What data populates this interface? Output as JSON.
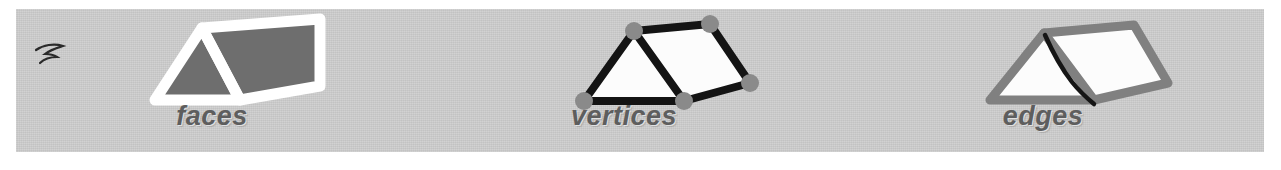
{
  "figure": {
    "background_color": "#ffffff",
    "band_color": "#cdcdcd"
  },
  "panels": [
    {
      "id": "faces",
      "caption": "faces",
      "shape": "triangular-prism",
      "highlight": "faces",
      "outline_color": "#ffffff",
      "fill_color": "#6e6e6e",
      "caption_color": "#5e5e5e",
      "has_ink_mark": true
    },
    {
      "id": "vertices",
      "caption": "vertices",
      "shape": "triangular-prism",
      "highlight": "vertices",
      "outline_color": "#111111",
      "fill_color": "#ffffff",
      "vertex_dot_color": "#8a8a8a",
      "vertex_count": 5,
      "caption_color": "#5e5e5e",
      "has_ink_mark": false
    },
    {
      "id": "edges",
      "caption": "edges",
      "shape": "triangular-prism",
      "highlight": "edges",
      "outline_color": "#808080",
      "fill_color": "#ffffff",
      "accent_edge_color": "#151515",
      "caption_color": "#5e5e5e",
      "has_ink_mark": false
    }
  ]
}
